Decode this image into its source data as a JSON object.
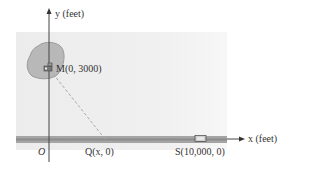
{
  "diagram": {
    "y_axis_label": "y (feet)",
    "x_axis_label": "x (feet)",
    "origin_label": "O",
    "points": {
      "M": {
        "label": "M(0, 3000)",
        "x": 0,
        "y": 3000
      },
      "Q": {
        "label": "Q(x, 0)",
        "x": "x",
        "y": 0
      },
      "S": {
        "label": "S(10,000, 0)",
        "x": 10000,
        "y": 0
      }
    },
    "icons": {
      "M": "house-icon",
      "S": "building-icon"
    },
    "colors": {
      "panel": "#ededed",
      "blob": "#b4b4b4",
      "road": "#999999",
      "axis": "#444444",
      "dashed_line": "#aaaaaa"
    }
  }
}
